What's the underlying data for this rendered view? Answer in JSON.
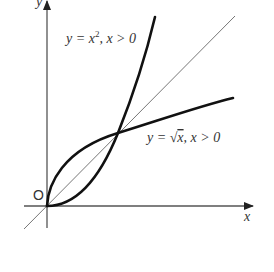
{
  "diagram": {
    "axes": {
      "x_label": "x",
      "y_label": "y",
      "origin_label": "O"
    },
    "curves": [
      {
        "name": "parabola",
        "expression": "y = x², x > 0",
        "label_parts": {
          "lhs": "y = x",
          "sup": "2",
          "rhs": ", x > 0"
        }
      },
      {
        "name": "square-root",
        "expression": "y = √x, x > 0",
        "label_parts": {
          "lhs": "y = ",
          "radical": "√",
          "radicand": "x",
          "rhs": ", x > 0"
        }
      },
      {
        "name": "identity-line",
        "expression": "y = x"
      }
    ],
    "intersection_points": [
      {
        "x": 0,
        "y": 0
      },
      {
        "x": 1,
        "y": 1
      }
    ],
    "colors": {
      "curves": "#111111",
      "axes": "#555555",
      "line": "#777777",
      "text": "#333333"
    }
  }
}
